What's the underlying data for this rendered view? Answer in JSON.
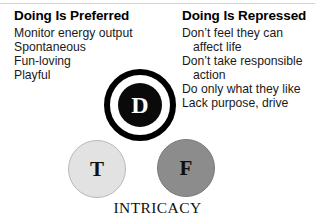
{
  "figure": {
    "caption": "INTRICACY"
  },
  "columns": {
    "left": {
      "heading": "Doing Is Preferred",
      "items": [
        {
          "text": "Monitor energy output",
          "indent": false
        },
        {
          "text": "Spontaneous",
          "indent": false
        },
        {
          "text": "Fun-loving",
          "indent": false
        },
        {
          "text": "Playful",
          "indent": false
        }
      ]
    },
    "right": {
      "heading": "Doing Is Repressed",
      "items": [
        {
          "text": "Don’t feel they can",
          "indent": false
        },
        {
          "text": "affect life",
          "indent": true
        },
        {
          "text": "Don’t take responsible",
          "indent": false
        },
        {
          "text": "action",
          "indent": true
        },
        {
          "text": "Do only what they like",
          "indent": false
        },
        {
          "text": "Lack purpose, drive",
          "indent": false
        }
      ]
    }
  },
  "diagram": {
    "nodes": [
      {
        "id": "d",
        "label": "D",
        "fill": "#0a0a0a",
        "text_color": "#ffffff"
      },
      {
        "id": "t",
        "label": "T",
        "fill": "#e2e2e2",
        "text_color": "#111111"
      },
      {
        "id": "f",
        "label": "F",
        "fill": "#8c8c8c",
        "text_color": "#0d0d0d"
      }
    ]
  }
}
